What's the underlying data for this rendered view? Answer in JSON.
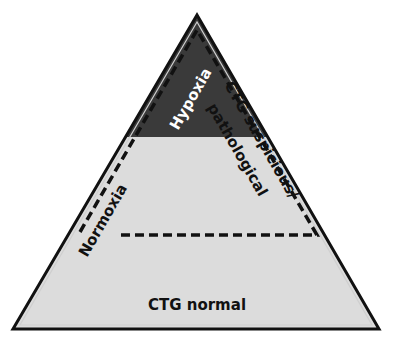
{
  "diagram": {
    "type": "pyramid",
    "colors": {
      "base_fill": "#dcdcdc",
      "top_fill": "#3a3a3a",
      "outline": "#111111",
      "dash": "#111111",
      "hypoxia_text": "#ffffff",
      "text": "#111111"
    },
    "labels": {
      "hypoxia": "Hypoxia",
      "ctg_suspicious_line1": "CTG suspicious/",
      "ctg_suspicious_line2": "pathological",
      "normoxia": "Normoxia",
      "ctg_normal": "CTG normal"
    }
  }
}
